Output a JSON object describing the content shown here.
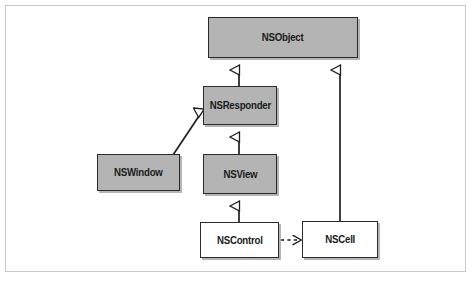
{
  "figure": {
    "type": "uml-class-diagram",
    "background_color": "#ffffff",
    "frame_color": "#c9c9c9",
    "filled_node_color": "#b4b4b4",
    "hollow_node_color": "#ffffff",
    "stroke_color": "#2b2b2b"
  },
  "nodes": [
    {
      "id": "nsobject",
      "label": "NSObject",
      "fill": "shaded",
      "x": 208,
      "y": 17,
      "w": 150,
      "h": 41
    },
    {
      "id": "nsresponder",
      "label": "NSResponder",
      "fill": "shaded",
      "x": 203,
      "y": 86,
      "w": 74,
      "h": 39
    },
    {
      "id": "nswindow",
      "label": "NSWindow",
      "fill": "shaded",
      "x": 97,
      "y": 154,
      "w": 83,
      "h": 37
    },
    {
      "id": "nsview",
      "label": "NSView",
      "fill": "shaded",
      "x": 203,
      "y": 154,
      "w": 74,
      "h": 40
    },
    {
      "id": "nscontrol",
      "label": "NSControl",
      "fill": "white",
      "x": 200,
      "y": 222,
      "w": 79,
      "h": 36
    },
    {
      "id": "nscell",
      "label": "NSCell",
      "fill": "white",
      "x": 302,
      "y": 221,
      "w": 76,
      "h": 37
    }
  ],
  "edges": [
    {
      "id": "edge-nsresponder-nsobject",
      "from": "NSResponder",
      "to": "NSObject",
      "kind": "inheritance",
      "line": "solid",
      "arrowhead": "hollow-triangle"
    },
    {
      "id": "edge-nscell-nsobject",
      "from": "NSCell",
      "to": "NSObject",
      "kind": "inheritance",
      "line": "solid",
      "arrowhead": "hollow-triangle"
    },
    {
      "id": "edge-nswindow-nsresponder",
      "from": "NSWindow",
      "to": "NSResponder",
      "kind": "inheritance",
      "line": "solid",
      "arrowhead": "hollow-triangle"
    },
    {
      "id": "edge-nsview-nsresponder",
      "from": "NSView",
      "to": "NSResponder",
      "kind": "inheritance",
      "line": "solid",
      "arrowhead": "hollow-triangle"
    },
    {
      "id": "edge-nscontrol-nsview",
      "from": "NSControl",
      "to": "NSView",
      "kind": "inheritance",
      "line": "solid",
      "arrowhead": "hollow-triangle"
    },
    {
      "id": "edge-nscontrol-nscell",
      "from": "NSControl",
      "to": "NSCell",
      "kind": "dependency",
      "line": "dashed",
      "arrowhead": "open-vee"
    }
  ]
}
